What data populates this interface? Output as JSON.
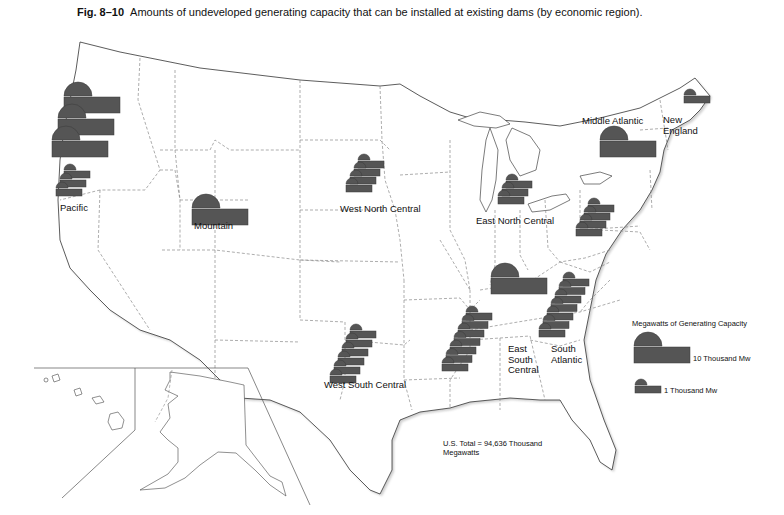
{
  "figure": {
    "number": "Fig. 8–10",
    "caption": "Amounts of undeveloped generating capacity that can be installed at existing dams (by economic region)."
  },
  "colors": {
    "symbol_fill": "#555555",
    "symbol_stroke": "#3a3a3a",
    "state_border": "#9a9a9a",
    "coast": "#333333",
    "background": "#ffffff"
  },
  "legend": {
    "title": "Megawatts of Generating Capacity",
    "large_label": "10 Thousand Mw",
    "small_label": "1 Thousand Mw"
  },
  "total_note": {
    "line1": "U.S. Total = 94,636 Thousand",
    "line2": "Megawatts"
  },
  "regions": [
    {
      "name": "Pacific",
      "label_lines": [
        "Pacific"
      ],
      "label_x": 60,
      "label_y": 264,
      "large_units": 3,
      "small_units": 3
    },
    {
      "name": "Mountain",
      "label_lines": [
        "Mountain"
      ],
      "label_x": 194,
      "label_y": 297,
      "large_units": 1,
      "small_units": 0
    },
    {
      "name": "West North Central",
      "label_lines": [
        "West North Central"
      ],
      "label_x": 340,
      "label_y": 271,
      "large_units": 0,
      "small_units": 4
    },
    {
      "name": "East North Central",
      "label_lines": [
        "East North Central"
      ],
      "label_x": 476,
      "label_y": 292,
      "large_units": 1,
      "small_units": 3
    },
    {
      "name": "Middle Atlantic",
      "label_lines": [
        "Middle Atlantic"
      ],
      "label_x": 582,
      "label_y": 140,
      "large_units": 1,
      "small_units": 4
    },
    {
      "name": "New England",
      "label_lines": [
        "New",
        "England"
      ],
      "label_x": 663,
      "label_y": 135,
      "large_units": 0,
      "small_units": 1
    },
    {
      "name": "West South Central",
      "label_lines": [
        "West South Central"
      ],
      "label_x": 324,
      "label_y": 534,
      "large_units": 0,
      "small_units": 6
    },
    {
      "name": "East South Central",
      "label_lines": [
        "East",
        "South",
        "Central"
      ],
      "label_x": 508,
      "label_y": 475,
      "large_units": 0,
      "small_units": 7
    },
    {
      "name": "South Atlantic",
      "label_lines": [
        "South",
        "Atlantic"
      ],
      "label_x": 551,
      "label_y": 472,
      "large_units": 0,
      "small_units": 7
    }
  ],
  "chart_data": {
    "type": "map-symbols",
    "unit": "Thousand Mw",
    "symbol_key": {
      "large_symbol": 10,
      "small_symbol": 1
    },
    "categories": [
      "Pacific",
      "Mountain",
      "West North Central",
      "East North Central",
      "Middle Atlantic",
      "New England",
      "West South Central",
      "East South Central",
      "South Atlantic"
    ],
    "symbols_large": [
      3,
      1,
      0,
      1,
      1,
      0,
      0,
      0,
      0
    ],
    "symbols_small": [
      3,
      0,
      4,
      3,
      4,
      1,
      6,
      7,
      7
    ],
    "values_estimated": [
      33,
      10,
      4,
      13,
      14,
      1,
      6,
      7,
      7
    ],
    "total": 94636,
    "total_label": "U.S. Total = 94,636 Thousand Megawatts",
    "legend": [
      "10 Thousand Mw",
      "1 Thousand Mw"
    ]
  }
}
